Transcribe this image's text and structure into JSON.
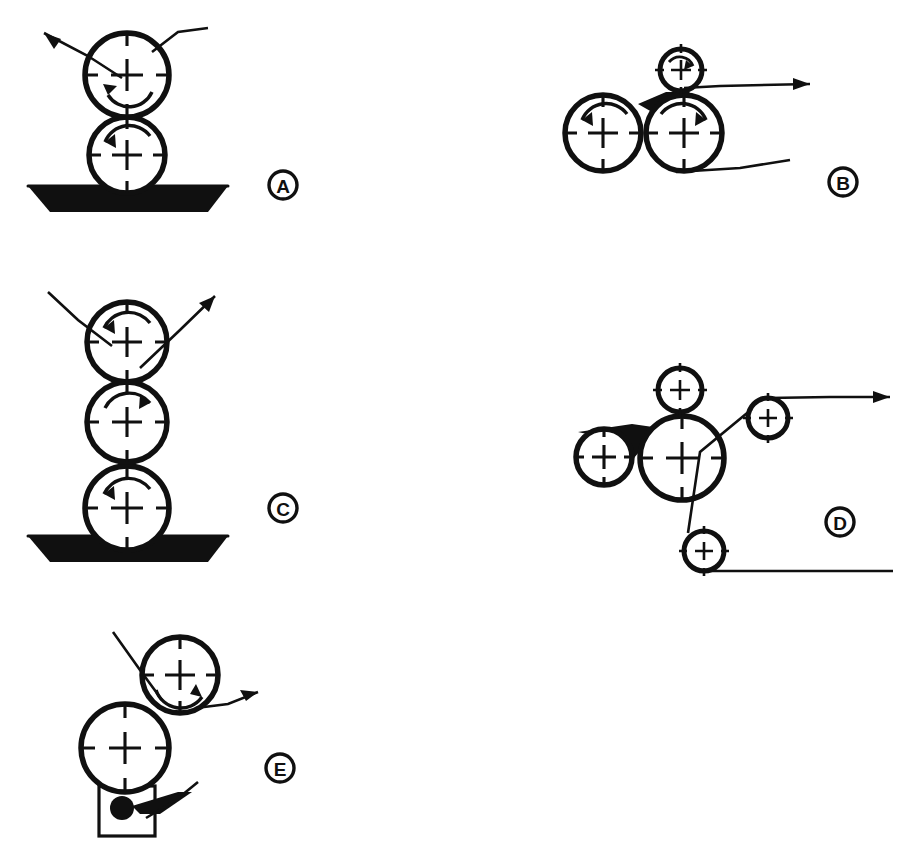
{
  "figure": {
    "background_color": "#ffffff",
    "ink_color": "#101010",
    "width": 908,
    "height": 861,
    "panel_count": 5
  },
  "panels": [
    {
      "id": "A",
      "label": "A",
      "label_position": {
        "x": 283,
        "y": 185
      },
      "description": "Two-roll vertical stack dipping into a pan; web enters upper right, exits upper left",
      "origin": {
        "x": 0,
        "y": 0
      },
      "rollers": [
        {
          "name": "upper-roller",
          "cx": 127,
          "cy": 75,
          "r": 42,
          "size": "large",
          "rotation": "counterclockwise"
        },
        {
          "name": "lower-roller",
          "cx": 127,
          "cy": 155,
          "r": 38,
          "size": "large",
          "rotation": "counterclockwise"
        }
      ],
      "pan": {
        "name": "coating-pan",
        "top_left_x": 28,
        "top_right_x": 228,
        "bottom_left_x": 50,
        "bottom_right_x": 208,
        "top_y": 186,
        "bottom_y": 212,
        "filled": true
      },
      "web_paths": [
        {
          "name": "web-exit",
          "points": "122,78 88,56 44,33",
          "arrow_at": "end",
          "arrow_angle": -147
        },
        {
          "name": "web-entry",
          "points": "152,52 178,32 208,28",
          "arrow_at": "none"
        }
      ]
    },
    {
      "id": "B",
      "label": "B",
      "label_position": {
        "x": 843,
        "y": 182
      },
      "description": "Two large rolls side by side forming a nip with flooded pond, small metering roll on top, web exits right",
      "origin": {
        "x": 0,
        "y": 0
      },
      "rollers": [
        {
          "name": "left-roller",
          "cx": 603,
          "cy": 133,
          "r": 38,
          "size": "large",
          "rotation": "counterclockwise"
        },
        {
          "name": "right-roller",
          "cx": 684,
          "cy": 133,
          "r": 38,
          "size": "large",
          "rotation": "clockwise"
        },
        {
          "name": "top-small-roller",
          "cx": 681,
          "cy": 70,
          "r": 21,
          "size": "small",
          "rotation": "clockwise"
        }
      ],
      "nip_pond": {
        "name": "nip-pond-fill",
        "filled": true
      },
      "web_paths": [
        {
          "name": "web-exit",
          "points": "684,88 720,86 810,84",
          "arrow_at": "end",
          "arrow_angle": 0
        },
        {
          "name": "web-entry",
          "points": "676,172 740,168 790,160",
          "arrow_at": "none"
        }
      ]
    },
    {
      "id": "C",
      "label": "C",
      "label_position": {
        "x": 283,
        "y": 508
      },
      "description": "Three-roll vertical stack dipping into a pan; web enters upper left, exits upper right",
      "origin": {
        "x": 0,
        "y": 0
      },
      "rollers": [
        {
          "name": "top-roller",
          "cx": 127,
          "cy": 342,
          "r": 40,
          "size": "large",
          "rotation": "counterclockwise"
        },
        {
          "name": "middle-roller",
          "cx": 127,
          "cy": 422,
          "r": 40,
          "size": "large",
          "rotation": "clockwise"
        },
        {
          "name": "bottom-roller",
          "cx": 127,
          "cy": 508,
          "r": 42,
          "size": "large",
          "rotation": "counterclockwise"
        }
      ],
      "pan": {
        "name": "coating-pan",
        "top_left_x": 28,
        "top_right_x": 228,
        "bottom_left_x": 50,
        "bottom_right_x": 208,
        "top_y": 536,
        "bottom_y": 562,
        "filled": true
      },
      "web_paths": [
        {
          "name": "web-entry",
          "points": "48,292 78,320 112,346",
          "arrow_at": "none"
        },
        {
          "name": "web-exit",
          "points": "140,368 180,330 215,296",
          "arrow_at": "end",
          "arrow_angle": -44
        }
      ]
    },
    {
      "id": "D",
      "label": "D",
      "label_position": {
        "x": 840,
        "y": 522
      },
      "description": "Large central applicator roll with small metering roll on top, side nip roll, and web routed over idlers to the right",
      "origin": {
        "x": 0,
        "y": 0
      },
      "rollers": [
        {
          "name": "central-roller",
          "cx": 682,
          "cy": 458,
          "r": 42,
          "size": "large",
          "rotation": "none"
        },
        {
          "name": "left-nip-roller",
          "cx": 604,
          "cy": 457,
          "r": 28,
          "size": "medium",
          "rotation": "none"
        },
        {
          "name": "top-metering-roller",
          "cx": 680,
          "cy": 390,
          "r": 22,
          "size": "small",
          "rotation": "none"
        },
        {
          "name": "upper-idler-roller",
          "cx": 768,
          "cy": 418,
          "r": 20,
          "size": "small",
          "rotation": "none"
        },
        {
          "name": "lower-idler-roller",
          "cx": 704,
          "cy": 551,
          "r": 20,
          "size": "small",
          "rotation": "none"
        }
      ],
      "nip_pond": {
        "name": "nip-pond-fill",
        "filled": true
      },
      "web_paths": [
        {
          "name": "web-exit-top",
          "points": "768,398 830,397 890,397",
          "arrow_at": "end",
          "arrow_angle": 0
        },
        {
          "name": "web-wrap",
          "points": "752,409 700,452 688,533",
          "arrow_at": "none"
        },
        {
          "name": "web-exit-bottom",
          "points": "704,571 800,571 893,571",
          "arrow_at": "none"
        }
      ]
    },
    {
      "id": "E",
      "label": "E",
      "label_position": {
        "x": 280,
        "y": 768
      },
      "description": "Applicator roll with doctor-blade fountain box and rod; transfer roll above, web enters upper left and exits right",
      "origin": {
        "x": 0,
        "y": 0
      },
      "rollers": [
        {
          "name": "upper-roller",
          "cx": 180,
          "cy": 675,
          "r": 38,
          "size": "large",
          "rotation": "clockwise"
        },
        {
          "name": "lower-roller",
          "cx": 125,
          "cy": 748,
          "r": 44,
          "size": "large",
          "rotation": "none"
        }
      ],
      "fountain_box": {
        "name": "fountain-box",
        "x": 99,
        "y": 786,
        "width": 56,
        "height": 50
      },
      "metering_rod": {
        "name": "metering-rod",
        "cx": 122,
        "cy": 808,
        "r": 12,
        "filled": true
      },
      "doctor_blade": {
        "name": "doctor-blade-wedge",
        "filled": true
      },
      "web_paths": [
        {
          "name": "web-entry",
          "points": "113,632 140,670 162,700",
          "arrow_at": "none"
        },
        {
          "name": "web-exit",
          "points": "196,708 228,704 258,692",
          "arrow_at": "end",
          "arrow_angle": -22
        },
        {
          "name": "blade-arm",
          "points": "146,818 176,800 198,782",
          "arrow_at": "none"
        }
      ]
    }
  ]
}
